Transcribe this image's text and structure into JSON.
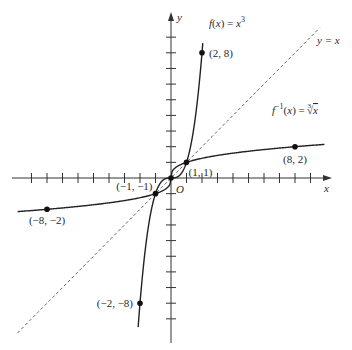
{
  "chart_data": {
    "type": "line",
    "title": "",
    "xlabel": "x",
    "ylabel": "y",
    "origin_label": "O",
    "xlim": [
      -10,
      10
    ],
    "ylim": [
      -10,
      10
    ],
    "x_ticks": [
      -9,
      -8,
      -7,
      -6,
      -5,
      -4,
      -3,
      -2,
      -1,
      1,
      2,
      3,
      4,
      5,
      6,
      7,
      8,
      9
    ],
    "y_ticks": [
      -9,
      -8,
      -7,
      -6,
      -5,
      -4,
      -3,
      -2,
      -1,
      1,
      2,
      3,
      4,
      5,
      6,
      7,
      8,
      9
    ],
    "grid": false,
    "series": [
      {
        "name": "f(x) = x^3",
        "label_text": "f(x) = x",
        "label_sup": "3",
        "style": "solid",
        "function": "cube",
        "x_range": [
          -2.12,
          2.05
        ]
      },
      {
        "name": "f^-1(x) = cbrt(x)",
        "label_text": "f",
        "label_sup": "−1",
        "label_tail": "(x) = ∛x",
        "style": "solid",
        "function": "cbrt",
        "x_range": [
          -9.9,
          9.9
        ]
      },
      {
        "name": "y = x",
        "label_text": "y = x",
        "style": "dashed",
        "function": "identity",
        "x_range": [
          -9.9,
          9.6
        ]
      }
    ],
    "points": [
      {
        "x": 2,
        "y": 8,
        "label": "(2, 8)"
      },
      {
        "x": 8,
        "y": 2,
        "label": "(8, 2)"
      },
      {
        "x": 1,
        "y": 1,
        "label": "(1, 1)"
      },
      {
        "x": -1,
        "y": -1,
        "label": "(−1, −1)"
      },
      {
        "x": -8,
        "y": -2,
        "label": "(−8, −2)"
      },
      {
        "x": -2,
        "y": -8,
        "label": "(−2, −8)"
      },
      {
        "x": 0,
        "y": 0,
        "label": ""
      }
    ]
  }
}
